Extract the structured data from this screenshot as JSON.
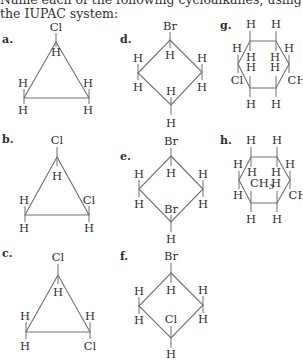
{
  "prompt": "Name each of the following cycloalkanes, using the IUPAC system:",
  "colors": {
    "line": "#707070",
    "text": "#2f2f2f"
  },
  "structures": [
    {
      "id": "a",
      "label": "a.",
      "label_pos": [
        2,
        43
      ],
      "ring": "triangle",
      "vertices": [
        [
          56,
          42
        ],
        [
          24,
          98
        ],
        [
          89,
          98
        ]
      ],
      "atoms": [
        {
          "text": "Cl",
          "x": 56,
          "y": 31,
          "bond_from": [
            56,
            33
          ],
          "bond_to": [
            56,
            42
          ]
        },
        {
          "text": "H",
          "x": 56,
          "y": 56,
          "bond_from": [
            56,
            42
          ],
          "bond_to": [
            56,
            47
          ]
        },
        {
          "text": "H",
          "x": 23,
          "y": 87,
          "bond_from": [
            24,
            89
          ],
          "bond_to": [
            24,
            98
          ]
        },
        {
          "text": "H",
          "x": 23,
          "y": 114,
          "bond_from": [
            24,
            98
          ],
          "bond_to": [
            24,
            104
          ]
        },
        {
          "text": "H",
          "x": 88,
          "y": 87,
          "bond_from": [
            89,
            89
          ],
          "bond_to": [
            89,
            98
          ]
        },
        {
          "text": "H",
          "x": 88,
          "y": 114,
          "bond_from": [
            89,
            98
          ],
          "bond_to": [
            89,
            104
          ]
        }
      ]
    },
    {
      "id": "b",
      "label": "b.",
      "label_pos": [
        2,
        143
      ],
      "ring": "triangle",
      "vertices": [
        [
          57,
          157
        ],
        [
          25,
          215
        ],
        [
          89,
          215
        ]
      ],
      "atoms": [
        {
          "text": "Cl",
          "x": 57,
          "y": 144,
          "bond_from": [
            57,
            147
          ],
          "bond_to": [
            57,
            157
          ]
        },
        {
          "text": "H",
          "x": 57,
          "y": 180,
          "bond_from": [
            57,
            157
          ],
          "bond_to": [
            57,
            166
          ]
        },
        {
          "text": "H",
          "x": 24,
          "y": 204,
          "bond_from": [
            25,
            206
          ],
          "bond_to": [
            25,
            215
          ]
        },
        {
          "text": "H",
          "x": 24,
          "y": 232,
          "bond_from": [
            25,
            215
          ],
          "bond_to": [
            25,
            222
          ]
        },
        {
          "text": "Cl",
          "x": 89,
          "y": 204,
          "bond_from": [
            89,
            206
          ],
          "bond_to": [
            89,
            215
          ]
        },
        {
          "text": "H",
          "x": 89,
          "y": 232,
          "bond_from": [
            89,
            215
          ],
          "bond_to": [
            89,
            222
          ]
        }
      ]
    },
    {
      "id": "c",
      "label": "c.",
      "label_pos": [
        2,
        257
      ],
      "ring": "triangle",
      "vertices": [
        [
          58,
          275
        ],
        [
          26,
          332
        ],
        [
          90,
          332
        ]
      ],
      "atoms": [
        {
          "text": "Cl",
          "x": 58,
          "y": 261,
          "bond_from": [
            58,
            264
          ],
          "bond_to": [
            58,
            275
          ]
        },
        {
          "text": "H",
          "x": 58,
          "y": 296,
          "bond_from": [
            58,
            275
          ],
          "bond_to": [
            58,
            284
          ]
        },
        {
          "text": "H",
          "x": 25,
          "y": 320,
          "bond_from": [
            26,
            322
          ],
          "bond_to": [
            26,
            332
          ]
        },
        {
          "text": "H",
          "x": 25,
          "y": 350,
          "bond_from": [
            26,
            332
          ],
          "bond_to": [
            26,
            339
          ]
        },
        {
          "text": "H",
          "x": 90,
          "y": 320,
          "bond_from": [
            90,
            322
          ],
          "bond_to": [
            90,
            332
          ]
        },
        {
          "text": "Cl",
          "x": 90,
          "y": 350,
          "bond_from": [
            90,
            332
          ],
          "bond_to": [
            90,
            339
          ]
        }
      ]
    },
    {
      "id": "d",
      "label": "d.",
      "label_pos": [
        120,
        43
      ],
      "ring": "diamond",
      "vertices": [
        [
          170,
          40
        ],
        [
          202,
          72
        ],
        [
          171,
          105
        ],
        [
          138,
          73
        ]
      ],
      "atoms": [
        {
          "text": "Br",
          "x": 170,
          "y": 30,
          "bond_from": [
            170,
            32
          ],
          "bond_to": [
            170,
            40
          ]
        },
        {
          "text": "H",
          "x": 170,
          "y": 59,
          "bond_from": [
            170,
            40
          ],
          "bond_to": [
            170,
            48
          ]
        },
        {
          "text": "H",
          "x": 138,
          "y": 62,
          "bond_from": [
            138,
            64
          ],
          "bond_to": [
            138,
            73
          ]
        },
        {
          "text": "H",
          "x": 138,
          "y": 91,
          "bond_from": [
            138,
            73
          ],
          "bond_to": [
            138,
            80
          ]
        },
        {
          "text": "H",
          "x": 202,
          "y": 62,
          "bond_from": [
            202,
            64
          ],
          "bond_to": [
            202,
            72
          ]
        },
        {
          "text": "H",
          "x": 202,
          "y": 91,
          "bond_from": [
            202,
            72
          ],
          "bond_to": [
            202,
            80
          ]
        },
        {
          "text": "H",
          "x": 171,
          "y": 95,
          "bond_from": [
            171,
            97
          ],
          "bond_to": [
            171,
            105
          ]
        },
        {
          "text": "H",
          "x": 171,
          "y": 127,
          "bond_from": [
            171,
            105
          ],
          "bond_to": [
            171,
            115
          ]
        }
      ]
    },
    {
      "id": "e",
      "label": "e.",
      "label_pos": [
        120,
        160
      ],
      "ring": "diamond",
      "vertices": [
        [
          171,
          156
        ],
        [
          203,
          189
        ],
        [
          171,
          222
        ],
        [
          139,
          189
        ]
      ],
      "atoms": [
        {
          "text": "Br",
          "x": 171,
          "y": 145,
          "bond_from": [
            171,
            148
          ],
          "bond_to": [
            171,
            156
          ]
        },
        {
          "text": "H",
          "x": 171,
          "y": 177,
          "bond_from": [
            171,
            156
          ],
          "bond_to": [
            171,
            166
          ]
        },
        {
          "text": "H",
          "x": 139,
          "y": 178,
          "bond_from": [
            139,
            180
          ],
          "bond_to": [
            139,
            189
          ]
        },
        {
          "text": "H",
          "x": 139,
          "y": 208,
          "bond_from": [
            139,
            189
          ],
          "bond_to": [
            139,
            197
          ]
        },
        {
          "text": "H",
          "x": 203,
          "y": 178,
          "bond_from": [
            203,
            180
          ],
          "bond_to": [
            203,
            189
          ]
        },
        {
          "text": "H",
          "x": 203,
          "y": 208,
          "bond_from": [
            203,
            189
          ],
          "bond_to": [
            203,
            197
          ]
        },
        {
          "text": "Br",
          "x": 171,
          "y": 213,
          "bond_from": [
            171,
            215
          ],
          "bond_to": [
            171,
            222
          ]
        },
        {
          "text": "H",
          "x": 171,
          "y": 243,
          "bond_from": [
            171,
            222
          ],
          "bond_to": [
            171,
            232
          ]
        }
      ]
    },
    {
      "id": "f",
      "label": "f.",
      "label_pos": [
        120,
        260
      ],
      "ring": "diamond",
      "vertices": [
        [
          171,
          273
        ],
        [
          203,
          305
        ],
        [
          171,
          338
        ],
        [
          139,
          306
        ]
      ],
      "atoms": [
        {
          "text": "Br",
          "x": 171,
          "y": 260,
          "bond_from": [
            171,
            263
          ],
          "bond_to": [
            171,
            273
          ]
        },
        {
          "text": "H",
          "x": 171,
          "y": 294,
          "bond_from": [
            171,
            273
          ],
          "bond_to": [
            171,
            283
          ]
        },
        {
          "text": "H",
          "x": 139,
          "y": 295,
          "bond_from": [
            139,
            297
          ],
          "bond_to": [
            139,
            306
          ]
        },
        {
          "text": "H",
          "x": 139,
          "y": 324,
          "bond_from": [
            139,
            306
          ],
          "bond_to": [
            139,
            314
          ]
        },
        {
          "text": "H",
          "x": 203,
          "y": 294,
          "bond_from": [
            203,
            296
          ],
          "bond_to": [
            203,
            305
          ]
        },
        {
          "text": "H",
          "x": 203,
          "y": 323,
          "bond_from": [
            203,
            305
          ],
          "bond_to": [
            203,
            313
          ]
        },
        {
          "text": "Cl",
          "x": 171,
          "y": 323,
          "bond_from": [
            171,
            326
          ],
          "bond_to": [
            171,
            338
          ]
        },
        {
          "text": "H",
          "x": 171,
          "y": 358,
          "bond_from": [
            171,
            338
          ],
          "bond_to": [
            171,
            348
          ]
        }
      ]
    },
    {
      "id": "g",
      "label": "g.",
      "label_pos": [
        220,
        29
      ],
      "ring": "hexagon",
      "vertices": [
        [
          250,
          41
        ],
        [
          276,
          41
        ],
        [
          289,
          64
        ],
        [
          276,
          88
        ],
        [
          250,
          88
        ],
        [
          238,
          64
        ]
      ],
      "atoms": [
        {
          "text": "H",
          "x": 251,
          "y": 28,
          "bond_from": [
            250,
            31
          ],
          "bond_to": [
            250,
            41
          ]
        },
        {
          "text": "H",
          "x": 276,
          "y": 28,
          "bond_from": [
            276,
            31
          ],
          "bond_to": [
            276,
            41
          ]
        },
        {
          "text": "H",
          "x": 251,
          "y": 61,
          "bond_from": [
            250,
            41
          ],
          "bond_to": [
            250,
            51
          ]
        },
        {
          "text": "H",
          "x": 275,
          "y": 61,
          "bond_from": [
            276,
            41
          ],
          "bond_to": [
            276,
            51
          ]
        },
        {
          "text": "H",
          "x": 237,
          "y": 52,
          "bond_from": [
            238,
            55
          ],
          "bond_to": [
            238,
            64
          ]
        },
        {
          "text": "Cl",
          "x": 237,
          "y": 84,
          "bond_from": [
            238,
            64
          ],
          "bond_to": [
            238,
            73
          ]
        },
        {
          "text": "H",
          "x": 289,
          "y": 52,
          "bond_from": [
            289,
            55
          ],
          "bond_to": [
            289,
            64
          ]
        },
        {
          "text": "CH",
          "x": 297,
          "y": 84,
          "bond_from": [
            289,
            64
          ],
          "bond_to": [
            289,
            73
          ]
        },
        {
          "text": "H",
          "x": 251,
          "y": 71,
          "bond_from": [
            250,
            76
          ],
          "bond_to": [
            250,
            88
          ]
        },
        {
          "text": "H",
          "x": 275,
          "y": 71,
          "bond_from": [
            276,
            76
          ],
          "bond_to": [
            276,
            88
          ]
        },
        {
          "text": "H",
          "x": 251,
          "y": 108,
          "bond_from": [
            250,
            88
          ],
          "bond_to": [
            250,
            97
          ]
        },
        {
          "text": "H",
          "x": 276,
          "y": 108,
          "bond_from": [
            276,
            88
          ],
          "bond_to": [
            276,
            97
          ]
        }
      ]
    },
    {
      "id": "h",
      "label": "h.",
      "label_pos": [
        220,
        144
      ],
      "ring": "hexagon",
      "vertices": [
        [
          251,
          157
        ],
        [
          277,
          157
        ],
        [
          290,
          180
        ],
        [
          277,
          203
        ],
        [
          251,
          203
        ],
        [
          239,
          180
        ]
      ],
      "atoms": [
        {
          "text": "H",
          "x": 251,
          "y": 144,
          "bond_from": [
            251,
            147
          ],
          "bond_to": [
            251,
            157
          ]
        },
        {
          "text": "H",
          "x": 277,
          "y": 144,
          "bond_from": [
            277,
            147
          ],
          "bond_to": [
            277,
            157
          ]
        },
        {
          "text": "H",
          "x": 252,
          "y": 176,
          "bond_from": [
            251,
            157
          ],
          "bond_to": [
            251,
            167
          ]
        },
        {
          "text": "H",
          "x": 276,
          "y": 176,
          "bond_from": [
            277,
            157
          ],
          "bond_to": [
            277,
            167
          ]
        },
        {
          "text": "H",
          "x": 238,
          "y": 168,
          "bond_from": [
            239,
            171
          ],
          "bond_to": [
            239,
            180
          ]
        },
        {
          "text": "H",
          "x": 238,
          "y": 199,
          "bond_from": [
            239,
            180
          ],
          "bond_to": [
            239,
            189
          ]
        },
        {
          "text": "H",
          "x": 290,
          "y": 168,
          "bond_from": [
            290,
            171
          ],
          "bond_to": [
            290,
            180
          ]
        },
        {
          "text": "CH",
          "x": 298,
          "y": 199,
          "bond_from": [
            290,
            180
          ],
          "bond_to": [
            290,
            189
          ]
        },
        {
          "text": "CH",
          "sub": "3",
          "x": 262,
          "y": 187,
          "bond_from": [
            251,
            191
          ],
          "bond_to": [
            251,
            203
          ]
        },
        {
          "text": "H",
          "x": 276,
          "y": 187,
          "bond_from": [
            277,
            191
          ],
          "bond_to": [
            277,
            203
          ]
        },
        {
          "text": "H",
          "x": 251,
          "y": 223,
          "bond_from": [
            251,
            203
          ],
          "bond_to": [
            251,
            212
          ]
        },
        {
          "text": "H",
          "x": 277,
          "y": 223,
          "bond_from": [
            277,
            203
          ],
          "bond_to": [
            277,
            212
          ]
        }
      ]
    }
  ]
}
